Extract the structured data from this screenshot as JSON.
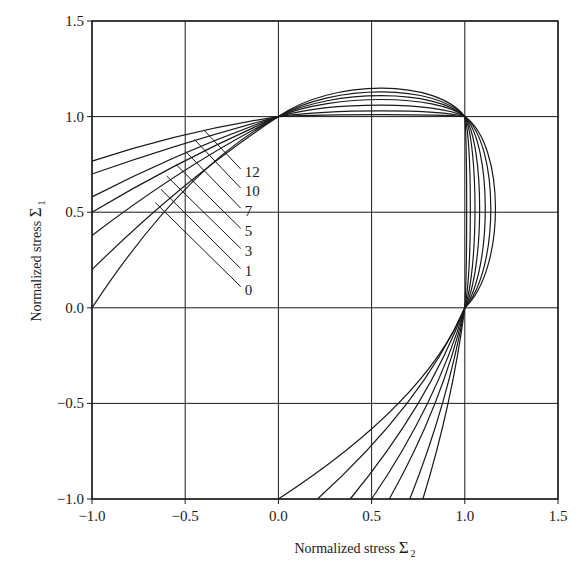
{
  "chart_data": {
    "type": "line",
    "title": "",
    "xlabel": "Normalized stress Σ2",
    "ylabel": "Normalized stress Σ1",
    "xlabel_text": "Normalized stress ",
    "xlabel_symbol": "Σ",
    "xlabel_subscript": "2",
    "ylabel_text": "Normalized stress ",
    "ylabel_symbol": "Σ",
    "ylabel_subscript": "1",
    "xlim": [
      -1.0,
      1.5
    ],
    "ylim": [
      -1.0,
      1.5
    ],
    "xticks": [
      "-1.0",
      "-0.5",
      "0.0",
      "0.5",
      "1.0",
      "1.5"
    ],
    "yticks": [
      "-1.0",
      "-0.5",
      "0.0",
      "0.5",
      "1.0",
      "1.5"
    ],
    "grid": true,
    "legend": "inline labels with leader lines",
    "series": [
      {
        "name": "0",
        "left_start_y": 0.0,
        "left_mid_y": 0.62,
        "top_peak_y": 1.15,
        "right_max_x": 1.165,
        "bottom_mid_x": 0.644,
        "bottom_end_x": 0.0
      },
      {
        "name": "1",
        "left_start_y": 0.2,
        "left_mid_y": 0.64,
        "top_peak_y": 1.13,
        "right_max_x": 1.14,
        "bottom_mid_x": 0.69,
        "bottom_end_x": 0.21
      },
      {
        "name": "3",
        "left_start_y": 0.378,
        "left_mid_y": 0.72,
        "top_peak_y": 1.11,
        "right_max_x": 1.11,
        "bottom_mid_x": 0.75,
        "bottom_end_x": 0.385
      },
      {
        "name": "5",
        "left_start_y": 0.5,
        "left_mid_y": 0.77,
        "top_peak_y": 1.09,
        "right_max_x": 1.08,
        "bottom_mid_x": 0.8,
        "bottom_end_x": 0.5
      },
      {
        "name": "7",
        "left_start_y": 0.58,
        "left_mid_y": 0.81,
        "top_peak_y": 1.06,
        "right_max_x": 1.055,
        "bottom_mid_x": 0.84,
        "bottom_end_x": 0.595
      },
      {
        "name": "10",
        "left_start_y": 0.7,
        "left_mid_y": 0.86,
        "top_peak_y": 1.03,
        "right_max_x": 1.03,
        "bottom_mid_x": 0.88,
        "bottom_end_x": 0.705
      },
      {
        "name": "12",
        "left_start_y": 0.767,
        "left_mid_y": 0.905,
        "top_peak_y": 1.01,
        "right_max_x": 1.01,
        "bottom_mid_x": 0.91,
        "bottom_end_x": 0.775
      }
    ],
    "curve_labels": [
      {
        "text": "12",
        "leader_from": [
          -0.4,
          0.93
        ],
        "label_y": 0.71
      },
      {
        "text": "10",
        "leader_from": [
          -0.45,
          0.88
        ],
        "label_y": 0.61
      },
      {
        "text": "7",
        "leader_from": [
          -0.5,
          0.82
        ],
        "label_y": 0.505
      },
      {
        "text": "5",
        "leader_from": [
          -0.55,
          0.75
        ],
        "label_y": 0.4
      },
      {
        "text": "3",
        "leader_from": [
          -0.6,
          0.69
        ],
        "label_y": 0.295
      },
      {
        "text": "1",
        "leader_from": [
          -0.63,
          0.62
        ],
        "label_y": 0.19
      },
      {
        "text": "0",
        "leader_from": [
          -0.66,
          0.55
        ],
        "label_y": 0.095
      }
    ],
    "label_x": -0.17
  }
}
